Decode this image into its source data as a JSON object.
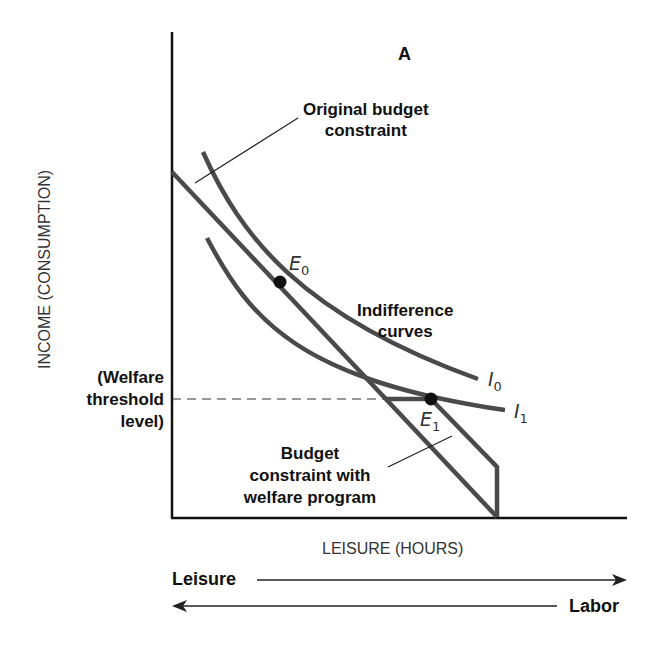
{
  "panel_label": "A",
  "axes": {
    "y_label": "INCOME (CONSUMPTION)",
    "x_label": "LEISURE (HOURS)"
  },
  "annotations": {
    "original_budget_line1": "Original budget",
    "original_budget_line2": "constraint",
    "indiff_line1": "Indifference",
    "indiff_line2": "curves",
    "welfare_line1": "(Welfare",
    "welfare_line2": "threshold",
    "welfare_line3": "level)",
    "welfare_budget_line1": "Budget",
    "welfare_budget_line2": "constraint with",
    "welfare_budget_line3": "welfare program"
  },
  "points": {
    "e0": "E",
    "e0_sub": "0",
    "e1": "E",
    "e1_sub": "1",
    "i0": "I",
    "i0_sub": "0",
    "i1": "I",
    "i1_sub": "1"
  },
  "arrows": {
    "leisure": "Leisure",
    "labor": "Labor"
  },
  "colors": {
    "curve": "#4a4a4a",
    "axis": "#111111"
  }
}
